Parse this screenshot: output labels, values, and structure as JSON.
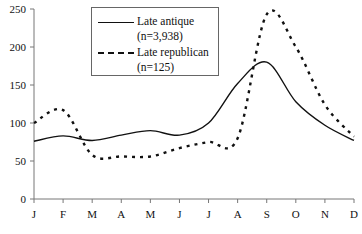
{
  "chart_data": {
    "type": "line",
    "title": "",
    "xlabel": "",
    "ylabel": "",
    "ylim": [
      0,
      250
    ],
    "yticks": [
      0,
      50,
      100,
      150,
      200,
      250
    ],
    "categories": [
      "J",
      "F",
      "M",
      "A",
      "M",
      "J",
      "J",
      "A",
      "S",
      "O",
      "N",
      "D"
    ],
    "grid": false,
    "legend_position": "upper-left-inside",
    "series": [
      {
        "name": "Late antique",
        "n_label": "(n=3,938)",
        "style": "solid",
        "color": "#111111",
        "values": [
          76,
          83,
          77,
          84,
          90,
          84,
          100,
          152,
          180,
          128,
          97,
          77
        ]
      },
      {
        "name": "Late republican",
        "n_label": "(n=125)",
        "style": "dotted",
        "color": "#111111",
        "values": [
          100,
          117,
          58,
          56,
          56,
          67,
          75,
          80,
          243,
          200,
          124,
          82
        ]
      }
    ]
  },
  "legend": {
    "items": [
      {
        "label": "Late antique",
        "sub": "(n=3,938)"
      },
      {
        "label": "Late republican",
        "sub": "(n=125)"
      }
    ]
  }
}
